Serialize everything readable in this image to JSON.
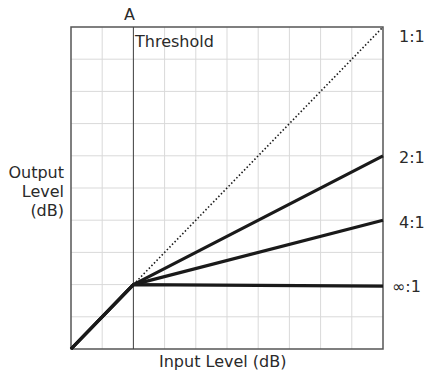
{
  "chart_data": {
    "type": "line",
    "title": "",
    "xlabel": "Input Level (dB)",
    "ylabel_lines": [
      "Output",
      "Level",
      "(dB)"
    ],
    "xlim": [
      0,
      10
    ],
    "ylim": [
      0,
      10
    ],
    "grid": true,
    "grid_divisions": 10,
    "threshold": {
      "x": 2,
      "marker_label": "A",
      "label": "Threshold"
    },
    "series": [
      {
        "name": "1:1",
        "style": "dotted",
        "points": [
          [
            0,
            0
          ],
          [
            2,
            2
          ],
          [
            10,
            10
          ]
        ]
      },
      {
        "name": "2:1",
        "style": "solid",
        "points": [
          [
            0,
            0
          ],
          [
            2,
            2
          ],
          [
            10,
            6
          ]
        ]
      },
      {
        "name": "4:1",
        "style": "solid",
        "points": [
          [
            0,
            0
          ],
          [
            2,
            2
          ],
          [
            10,
            4
          ]
        ]
      },
      {
        "name": "∞:1",
        "style": "solid",
        "points": [
          [
            0,
            0
          ],
          [
            2,
            2
          ],
          [
            10,
            1.95
          ]
        ]
      }
    ]
  },
  "labels": {
    "marker_a": "A",
    "threshold": "Threshold",
    "xlabel": "Input Level (dB)",
    "ylabel": [
      "Output",
      "Level",
      "(dB)"
    ],
    "ratio_1_1": "1:1",
    "ratio_2_1": "2:1",
    "ratio_4_1": "4:1",
    "ratio_inf_1": "∞:1"
  },
  "colors": {
    "frame": "#555555",
    "grid": "#d9d9d9",
    "curve": "#1a1a1a",
    "text": "#2a2a2a"
  }
}
